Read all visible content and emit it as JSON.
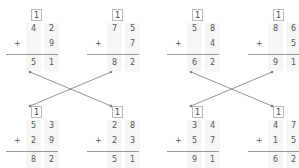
{
  "top_row": [
    {
      "carry": "1",
      "a": [
        "4",
        "2"
      ],
      "b": [
        "",
        "9"
      ],
      "sum": [
        "5",
        "1"
      ]
    },
    {
      "carry": "1",
      "a": [
        "7",
        "5"
      ],
      "b": [
        "",
        "7"
      ],
      "sum": [
        "8",
        "2"
      ]
    },
    {
      "carry": "1",
      "a": [
        "5",
        "8"
      ],
      "b": [
        "",
        "4"
      ],
      "sum": [
        "6",
        "2"
      ]
    },
    {
      "carry": "1",
      "a": [
        "8",
        "6"
      ],
      "b": [
        "",
        "5"
      ],
      "sum": [
        "9",
        "1"
      ]
    }
  ],
  "bottom_row": [
    {
      "carry": "1",
      "a": [
        "5",
        "3"
      ],
      "b": [
        "2",
        "9"
      ],
      "sum": [
        "8",
        "2"
      ]
    },
    {
      "carry": "1",
      "a": [
        "2",
        "8"
      ],
      "b": [
        "2",
        "3"
      ],
      "sum": [
        "5",
        "1"
      ]
    },
    {
      "carry": "1",
      "a": [
        "3",
        "4"
      ],
      "b": [
        "5",
        "7"
      ],
      "sum": [
        "9",
        "1"
      ]
    },
    {
      "carry": "1",
      "a": [
        "4",
        "7"
      ],
      "b": [
        "1",
        "5"
      ],
      "sum": [
        "6",
        "2"
      ]
    }
  ],
  "operator": "+"
}
